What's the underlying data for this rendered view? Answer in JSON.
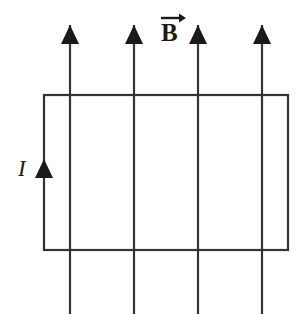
{
  "figure": {
    "background_color": "#ffffff",
    "stroke_color": "#333333",
    "fill_color": "#1a1a1a",
    "width": 302,
    "height": 325,
    "labels": {
      "magnetic_field": "B",
      "magnetic_field_description": "vector B, uniform magnetic field pointing up out of the page plane, upward in the plane",
      "current": "I",
      "current_description": "conventional current in the loop, flowing upward along the left side"
    },
    "loop": {
      "shape": "rectangle",
      "x": 44,
      "y": 95,
      "width": 244,
      "height": 155,
      "stroke_width": 2.2
    },
    "field_lines": [
      {
        "x": 70,
        "y_top": 25,
        "y_bottom": 314
      },
      {
        "x": 134,
        "y_top": 25,
        "y_bottom": 314
      },
      {
        "x": 198,
        "y_top": 25,
        "y_bottom": 314
      },
      {
        "x": 262,
        "y_top": 25,
        "y_bottom": 314
      }
    ],
    "field_arrow_head": {
      "half_width": 9,
      "height": 19,
      "direction": "up"
    },
    "current_arrow": {
      "x": 44,
      "tip_y": 159,
      "half_width": 9,
      "height": 19,
      "direction": "up"
    },
    "vector_accent": {
      "x1": 161,
      "x2": 186,
      "y": 18,
      "direction": "right"
    }
  }
}
